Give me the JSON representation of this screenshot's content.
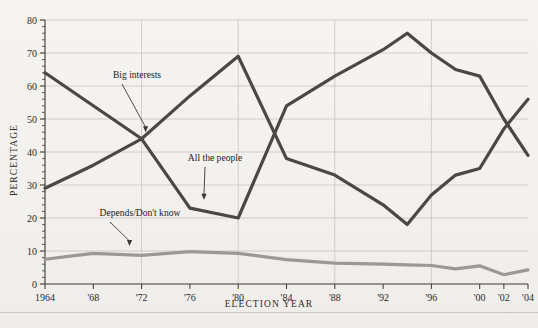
{
  "chart_data": {
    "type": "line",
    "title": "",
    "xlabel": "ELECTION YEAR",
    "ylabel": "PERCENTAGE",
    "xlim": [
      1964,
      2004
    ],
    "ylim": [
      0,
      80
    ],
    "grid": true,
    "legend_position": "inline-annotations",
    "x": [
      1964,
      1968,
      1972,
      1976,
      1980,
      1984,
      1988,
      1992,
      1994,
      1996,
      1998,
      2000,
      2002,
      2004
    ],
    "xtick_labels": [
      "1964",
      "'68",
      "'72",
      "'76",
      "'80",
      "'84",
      "'88",
      "'92",
      "'96",
      "'00",
      "'02",
      "'04"
    ],
    "xtick_values": [
      1964,
      1968,
      1972,
      1976,
      1980,
      1984,
      1988,
      1992,
      1996,
      2000,
      2002,
      2004
    ],
    "gridline_years": [
      1972,
      1980,
      1988,
      1996
    ],
    "ytick_labels": [
      "0",
      "10",
      "20",
      "30",
      "40",
      "50",
      "60",
      "70",
      "80"
    ],
    "ytick_values": [
      0,
      10,
      20,
      30,
      40,
      50,
      60,
      70,
      80
    ],
    "yminor_step": 2,
    "series": [
      {
        "name": "Big interests",
        "color": "#4a4846",
        "values": [
          64,
          54,
          44,
          23,
          20,
          54,
          63,
          71,
          76,
          70,
          65,
          63,
          50,
          39
        ]
      },
      {
        "name": "All the people",
        "color": "#4a4846",
        "values": [
          29,
          36,
          44,
          57,
          69,
          38,
          33,
          24,
          18,
          27,
          33,
          35,
          47,
          56
        ]
      },
      {
        "name": "Depends/Don't know",
        "color": "#9b9895",
        "values": [
          7.5,
          9.3,
          8.7,
          9.8,
          9.3,
          7.4,
          6.3,
          6.0,
          5.8,
          5.6,
          4.6,
          5.5,
          2.8,
          4.3
        ]
      }
    ],
    "annotations": [
      {
        "label": "Big interests",
        "target_series": "Big interests",
        "target_year": 1972,
        "target_value": 45
      },
      {
        "label": "All the people",
        "target_series": "All the people",
        "target_year": 1977,
        "target_value": 25
      },
      {
        "label": "Depends/Don't know",
        "target_series": "Depends/Don't know",
        "target_year": 1971,
        "target_value": 10
      }
    ]
  },
  "annotation_labels": {
    "big_interests": "Big interests",
    "all_the_people": "All the people",
    "depends": "Depends/Don't know"
  },
  "axes": {
    "y_title": "PERCENTAGE",
    "x_title": "ELECTION YEAR"
  },
  "colors": {
    "line_dark": "#4a4846",
    "line_light": "#9b9895",
    "grid": "#c6c4c1",
    "axis": "#3a3836",
    "background": "#f4f2ef"
  }
}
